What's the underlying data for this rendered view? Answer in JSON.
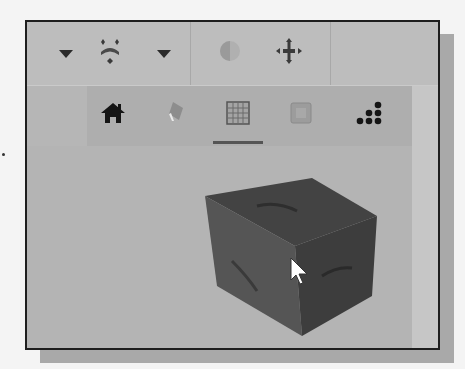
{
  "window": {
    "title": "",
    "frame_color": "#1e1e1e",
    "background_color": "#b9b9b9"
  },
  "toolbar_top": {
    "items": [
      {
        "icon": "dropdown-arrow-icon",
        "label": ""
      },
      {
        "icon": "zoom-fit-icon",
        "label": ""
      },
      {
        "icon": "dropdown-arrow-icon",
        "label": ""
      },
      {
        "icon": "shading-half-moon-icon",
        "label": "",
        "state": "disabled"
      },
      {
        "icon": "pan-move-icon",
        "label": ""
      }
    ]
  },
  "toolbar_nav": {
    "items": [
      {
        "icon": "home-icon",
        "label": "",
        "selected": false
      },
      {
        "icon": "eraser-icon",
        "label": "",
        "selected": false
      },
      {
        "icon": "grid-icon",
        "label": "",
        "selected": true
      },
      {
        "icon": "square-view-icon",
        "label": "",
        "state": "disabled",
        "selected": false
      },
      {
        "icon": "dot-triangle-icon",
        "label": "",
        "selected": false
      }
    ]
  },
  "viewport": {
    "object": "view-cube",
    "cube_face_labels": [
      "",
      "",
      ""
    ],
    "cursor": "arrow-pointer"
  }
}
